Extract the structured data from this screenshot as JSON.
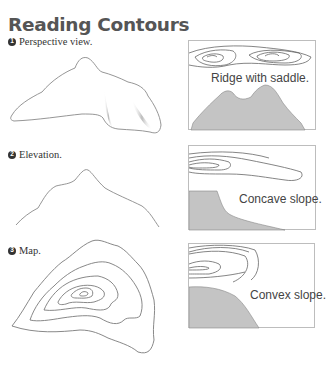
{
  "title": "Reading Contours",
  "steps": [
    {
      "number": "1",
      "label": "Perspective view."
    },
    {
      "number": "2",
      "label": "Elevation."
    },
    {
      "number": "3",
      "label": "Map."
    }
  ],
  "panels": [
    {
      "caption": "Ridge with saddle."
    },
    {
      "caption": "Concave slope."
    },
    {
      "caption": "Convex slope."
    }
  ],
  "colors": {
    "line": "#8a8a8a",
    "fill": "#c4c4c4",
    "title": "#555555"
  }
}
